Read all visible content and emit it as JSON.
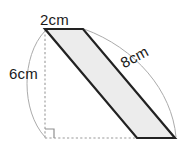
{
  "figure": {
    "type": "geometry-diagram",
    "shape": "parallelogram-with-height-and-base-construction",
    "labels": {
      "top": "2cm",
      "left": "6cm",
      "diagonal": "8cm"
    },
    "measurements": [
      {
        "name": "top-edge",
        "value": 2,
        "unit": "cm",
        "text": "2cm"
      },
      {
        "name": "vertical-height",
        "value": 6,
        "unit": "cm",
        "text": "6cm"
      },
      {
        "name": "slant-side",
        "value": 8,
        "unit": "cm",
        "text": "8cm"
      }
    ],
    "colors": {
      "shape_fill": "#ececec",
      "shape_stroke": "#222222",
      "dashed_stroke": "#9a9a9a",
      "arc_stroke": "#aaaaaa",
      "background": "#ffffff",
      "text": "#1a1a1a"
    },
    "geometry": {
      "parallelogram_points": "45,29 83,29 175,138 137,138",
      "dashed_vertical": {
        "x1": 45,
        "y1": 30,
        "x2": 45,
        "y2": 138
      },
      "dashed_horizontal": {
        "x1": 45,
        "y1": 138,
        "x2": 175,
        "y2": 138
      },
      "right_angle_marker": "45,128 55,128 55,138",
      "arc_left": "M 45,31 C 22,55 22,112 45,137",
      "arc_right": "M 83,29 C 135,47 172,90 175,137"
    }
  }
}
